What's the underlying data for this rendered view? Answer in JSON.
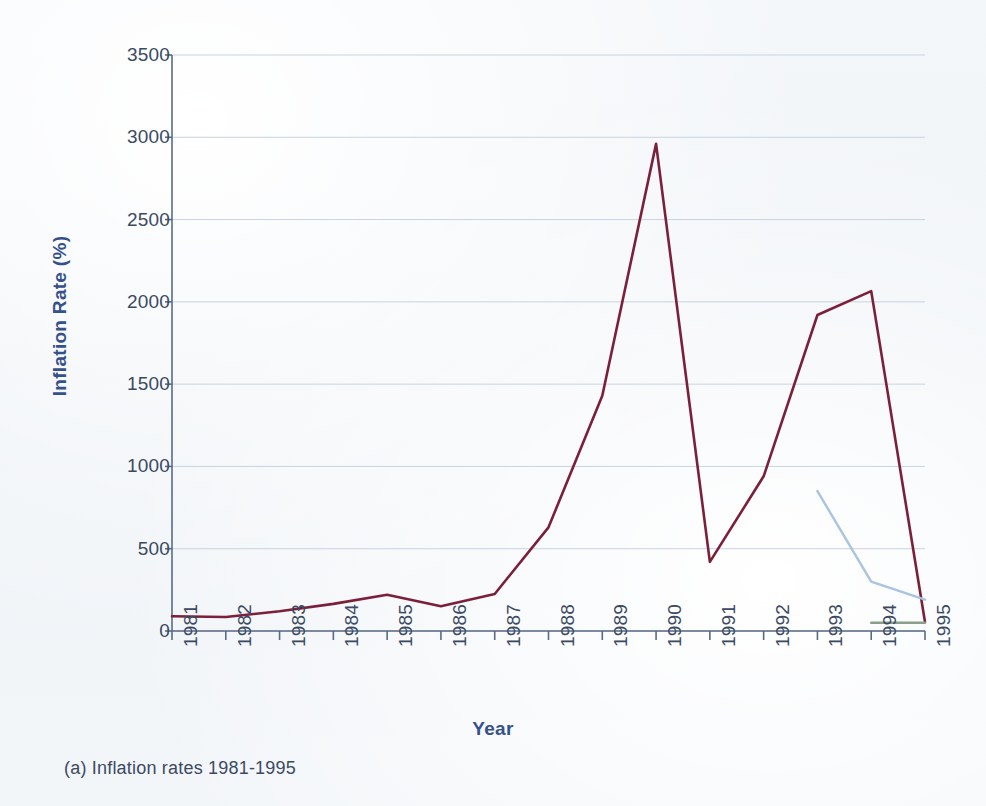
{
  "figure": {
    "caption": "(a) Inflation rates 1981-1995",
    "background_color": "#f2f5f8"
  },
  "chart_data": {
    "type": "line",
    "title": "",
    "xlabel": "Year",
    "ylabel": "Inflation Rate (%)",
    "categories": [
      "1981",
      "1982",
      "1983",
      "1984",
      "1985",
      "1986",
      "1987",
      "1988",
      "1989",
      "1990",
      "1991",
      "1992",
      "1993",
      "1994",
      "1995"
    ],
    "x": [
      1981,
      1982,
      1983,
      1984,
      1985,
      1986,
      1987,
      1988,
      1989,
      1990,
      1991,
      1992,
      1993,
      1994,
      1995
    ],
    "ylim": [
      0,
      3500
    ],
    "xlim": [
      1981,
      1995
    ],
    "yticks": [
      0,
      500,
      1000,
      1500,
      2000,
      2500,
      3000,
      3500
    ],
    "ytick_labels": [
      "0",
      "500",
      "1000",
      "1500",
      "2000",
      "2500",
      "3000",
      "3500"
    ],
    "grid": true,
    "grid_axis": "y",
    "legend": false,
    "legend_position": "none",
    "series": [
      {
        "name": "Inflation rate",
        "color": "#7b1f3a",
        "width": 2.6,
        "values": [
          90,
          85,
          120,
          165,
          220,
          150,
          225,
          630,
          1430,
          2960,
          420,
          940,
          1920,
          2065,
          55
        ]
      },
      {
        "name": "Secondary series",
        "color": "#a8c4e0",
        "width": 2.4,
        "x": [
          1993,
          1994,
          1995
        ],
        "values": [
          850,
          300,
          190
        ]
      },
      {
        "name": "Baseline series",
        "color": "#8aa08a",
        "width": 2.4,
        "x": [
          1994,
          1995
        ],
        "values": [
          50,
          50
        ]
      }
    ]
  },
  "axes": {
    "y_title": "Inflation Rate (%)",
    "x_title": "Year",
    "y_title_color": "#35518c",
    "x_title_color": "#35518c",
    "tick_label_color": "#3b4a63",
    "axis_line_color": "#5a6b85",
    "grid_color": "#c9d4e0"
  },
  "ghost_text": {
    "upper": "",
    "lower": ""
  }
}
